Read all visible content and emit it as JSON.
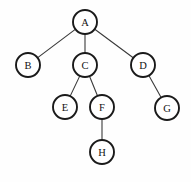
{
  "diagram": {
    "type": "tree",
    "background_color": "#fefefe",
    "node_fill_color": "#ffffff",
    "node_stroke_color": "#1a1a1a",
    "edge_color": "#3a3a3a",
    "label_color": "#111111",
    "node_radius": 12,
    "nodes": [
      {
        "id": "A",
        "label": "A",
        "cx": 85,
        "cy": 22,
        "r": 12
      },
      {
        "id": "B",
        "label": "B",
        "cx": 28,
        "cy": 65,
        "r": 12
      },
      {
        "id": "C",
        "label": "C",
        "cx": 85,
        "cy": 65,
        "r": 12
      },
      {
        "id": "D",
        "label": "D",
        "cx": 143,
        "cy": 65,
        "r": 12
      },
      {
        "id": "E",
        "label": "E",
        "cx": 65,
        "cy": 107,
        "r": 12
      },
      {
        "id": "F",
        "label": "F",
        "cx": 102,
        "cy": 107,
        "r": 12
      },
      {
        "id": "G",
        "label": "G",
        "cx": 167,
        "cy": 108,
        "r": 12
      },
      {
        "id": "H",
        "label": "H",
        "cx": 102,
        "cy": 152,
        "r": 12
      }
    ],
    "edges": [
      {
        "from": "A",
        "to": "B"
      },
      {
        "from": "A",
        "to": "C"
      },
      {
        "from": "A",
        "to": "D"
      },
      {
        "from": "C",
        "to": "E"
      },
      {
        "from": "C",
        "to": "F"
      },
      {
        "from": "D",
        "to": "G"
      },
      {
        "from": "F",
        "to": "H"
      }
    ]
  }
}
